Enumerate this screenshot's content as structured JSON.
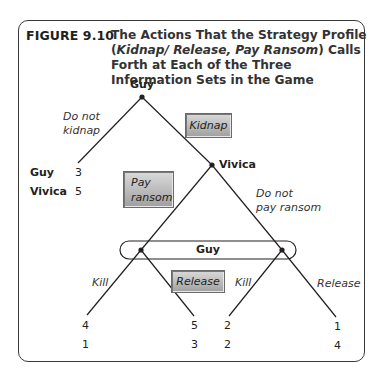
{
  "figure": {
    "label": "FIGURE",
    "number": "9.10",
    "title_plain_1": "The Actions That the Strategy Profile (",
    "title_italic": "Kidnap/ Release, Pay Ransom",
    "title_plain_2": ") Calls Forth at Each of the Three Information Sets in the Game"
  },
  "tree": {
    "root_player": "Guy",
    "second_player": "Vivica",
    "info_set_player": "Guy",
    "actions": {
      "do_not_kidnap_line1": "Do not",
      "do_not_kidnap_line2": "kidnap",
      "kidnap": "Kidnap",
      "pay_ransom_line1": "Pay",
      "pay_ransom_line2": "ransom",
      "do_not_pay_line1": "Do not",
      "do_not_pay_line2": "pay ransom",
      "kill_left": "Kill",
      "release_left": "Release",
      "kill_right": "Kill",
      "release_right": "Release"
    },
    "highlighted_actions": [
      "Kidnap",
      "Pay ransom",
      "Release"
    ],
    "payoff_labels": {
      "player1": "Guy",
      "player2": "Vivica"
    },
    "payoffs": {
      "do_not_kidnap": {
        "guy": "3",
        "vivica": "5"
      },
      "pay_kill": {
        "guy": "4",
        "vivica": "1"
      },
      "pay_release": {
        "guy": "5",
        "vivica": "3"
      },
      "nopay_kill": {
        "guy": "2",
        "vivica": "2"
      },
      "nopay_release": {
        "guy": "1",
        "vivica": "4"
      }
    }
  }
}
